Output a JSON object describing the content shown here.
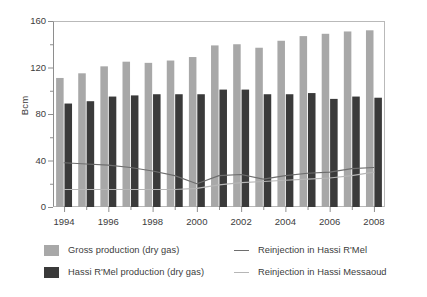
{
  "chart_data": {
    "type": "bar",
    "title": "",
    "subtitle": "",
    "xlabel": "",
    "ylabel": "Bcm",
    "ylim": [
      0,
      160
    ],
    "yticks": [
      0,
      40,
      80,
      120,
      160
    ],
    "yticks_minor": [
      20,
      60,
      100,
      140
    ],
    "grid": false,
    "legend_position": "bottom",
    "x": [
      1994,
      1995,
      1996,
      1997,
      1998,
      1999,
      2000,
      2001,
      2002,
      2003,
      2004,
      2005,
      2006,
      2007,
      2008
    ],
    "categories": [
      "1994",
      "1995",
      "1996",
      "1997",
      "1998",
      "1999",
      "2000",
      "2001",
      "2002",
      "2003",
      "2004",
      "2005",
      "2006",
      "2007",
      "2008"
    ],
    "xtick_labels": [
      "1994",
      "1996",
      "1998",
      "2000",
      "2002",
      "2004",
      "2006",
      "2008"
    ],
    "xtick_label_years": [
      1994,
      1996,
      1998,
      2000,
      2002,
      2004,
      2006,
      2008
    ],
    "series": [
      {
        "name": "Gross production (dry gas)",
        "kind": "bar",
        "color": "#a8a8a8",
        "values": [
          111,
          115,
          121,
          125,
          124,
          126,
          129,
          139,
          140,
          137,
          143,
          147,
          149,
          151,
          152
        ]
      },
      {
        "name": "Hassi R'Mel production (dry gas)",
        "kind": "bar",
        "color": "#3a3a3a",
        "values": [
          89,
          91,
          95,
          96,
          97,
          97,
          97,
          101,
          101,
          97,
          97,
          98,
          93,
          95,
          94
        ]
      },
      {
        "name": "Reinjection in Hassi R'Mel",
        "kind": "line",
        "color": "#6e6e6e",
        "values": [
          38,
          37,
          36,
          34,
          31,
          27,
          20,
          27,
          28,
          24,
          27,
          29,
          30,
          33,
          34
        ]
      },
      {
        "name": "Reinjection in Hassi Messaoud",
        "kind": "line",
        "color": "#b6b6b6",
        "values": [
          15,
          15,
          15,
          15,
          15,
          15,
          16,
          19,
          21,
          22,
          23,
          24,
          25,
          27,
          30
        ]
      }
    ]
  },
  "legend": {
    "entries": [
      {
        "label": "Gross production (dry gas)",
        "marker": "bar-swatch-light",
        "color": "#a8a8a8"
      },
      {
        "label": "Hassi R'Mel production (dry gas)",
        "marker": "bar-swatch-dark",
        "color": "#3a3a3a"
      },
      {
        "label": "Reinjection in Hassi R'Mel",
        "marker": "line-swatch-dark",
        "color": "#6e6e6e"
      },
      {
        "label": "Reinjection in Hassi Messaoud",
        "marker": "line-swatch-light",
        "color": "#b6b6b6"
      }
    ]
  },
  "colors": {
    "gross_production_bar": "#a8a8a8",
    "hassi_rmel_bar": "#3a3a3a",
    "reinjection_rmel_line": "#6e6e6e",
    "reinjection_messaoud_line": "#b6b6b6",
    "axis": "#8e8e8e",
    "frame": "#b9b9b9",
    "text": "#3c3c3c",
    "background": "#ffffff"
  }
}
